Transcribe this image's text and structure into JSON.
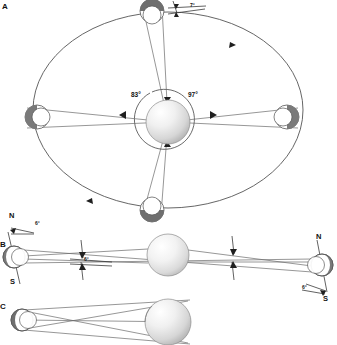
{
  "figure": {
    "background": "#ffffff",
    "line_color": "#4d4d4d",
    "dark_shade": "#6b6b6b",
    "sun_light": "#fdfdfd",
    "sun_mid": "#d8d8d8",
    "sun_edge": "#9a9a9a"
  },
  "panels": [
    {
      "id": "A",
      "letter": "A"
    },
    {
      "id": "B",
      "letter": "B"
    },
    {
      "id": "C",
      "letter": "C"
    }
  ],
  "panel_a": {
    "letter": "A",
    "angles": [
      {
        "name": "left-angle",
        "value": "83°"
      },
      {
        "name": "right-angle",
        "value": "97°"
      },
      {
        "name": "tilt-angle",
        "value": "7°"
      }
    ],
    "orbit": {
      "cx": 168,
      "cy": 110,
      "rx": 135,
      "ry": 98
    },
    "sun": {
      "cx": 168,
      "cy": 122,
      "r": 22
    },
    "bodies": [
      {
        "name": "body-top",
        "cx": 152,
        "cy": 11,
        "r": 12,
        "shade": "top"
      },
      {
        "name": "body-left",
        "cx": 37,
        "cy": 117,
        "r": 12,
        "shade": "left"
      },
      {
        "name": "body-right",
        "cx": 287,
        "cy": 117,
        "r": 12,
        "shade": "right"
      },
      {
        "name": "body-bottom",
        "cx": 152,
        "cy": 210,
        "r": 12,
        "shade": "bottom"
      }
    ],
    "orbit_arrows": [
      "arrow-upper-right",
      "arrow-lower-left"
    ]
  },
  "panel_b": {
    "letter": "B",
    "sun": {
      "cx": 168,
      "cy": 255,
      "r": 21
    },
    "left_body": {
      "cx": 14,
      "cy": 257,
      "r": 11
    },
    "right_body": {
      "cx": 322,
      "cy": 265,
      "r": 11
    },
    "labels": [
      {
        "name": "north-label-left",
        "value": "N"
      },
      {
        "name": "south-label-left",
        "value": "S"
      },
      {
        "name": "north-label-right",
        "value": "N"
      },
      {
        "name": "south-label-right",
        "value": "S"
      },
      {
        "name": "tilt-angle-left",
        "value": "6°"
      },
      {
        "name": "tilt-angle-right",
        "value": "6°"
      },
      {
        "name": "center-angle",
        "value": "6°"
      }
    ]
  },
  "panel_c": {
    "letter": "C",
    "sun": {
      "cx": 168,
      "cy": 322,
      "r": 23
    },
    "body": {
      "cx": 22,
      "cy": 320,
      "r": 11
    }
  }
}
